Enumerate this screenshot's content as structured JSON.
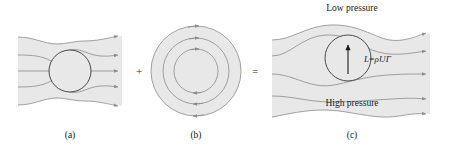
{
  "figure": {
    "title_text": "",
    "panels": [
      {
        "id": "a",
        "caption": "(a)",
        "description": "uniform-flow-past-cylinder",
        "caption_x": 70,
        "caption_y": 131
      },
      {
        "id": "b",
        "caption": "(b)",
        "description": "circulation-vortex-flow",
        "caption_x": 196,
        "caption_y": 131
      },
      {
        "id": "c",
        "caption": "(c)",
        "description": "combined-lifting-flow",
        "caption_x": 352,
        "caption_y": 131
      }
    ],
    "operators": [
      {
        "symbol": "+",
        "name": "plus-operator",
        "x": 139,
        "y": 71
      },
      {
        "symbol": "=",
        "name": "equals-operator",
        "x": 255,
        "y": 71
      }
    ],
    "annotations": {
      "low_pressure": "Low pressure",
      "high_pressure": "High pressure",
      "lift_equation": {
        "lhs": "L",
        "relation": "=",
        "rho": "ρ",
        "velocity": "U",
        "circulation": "Γ",
        "full": "L = ρUΓ"
      }
    },
    "colors": {
      "page_background": "#ffffff",
      "flow_fill": "#e8e8e8",
      "streamline_stroke": "#8c8c8c",
      "body_outline": "#4a4a4a",
      "lift_arrow": "#1a1a1a",
      "text": "#1a1a1a"
    },
    "geometry": {
      "panel_a": {
        "cylinder_cx": 70,
        "cylinder_cy": 71,
        "cylinder_r": 21,
        "arrowheads_right": 5
      },
      "panel_b": {
        "cx": 196,
        "cy": 71,
        "radii": [
          45,
          33,
          22
        ],
        "flow_direction": "clockwise",
        "arrowheads": 6
      },
      "panel_c": {
        "cylinder_cx": 348,
        "cylinder_cy": 58,
        "cylinder_r": 23,
        "arrowheads_right": 4,
        "lift_arrow_direction": "up"
      }
    }
  }
}
